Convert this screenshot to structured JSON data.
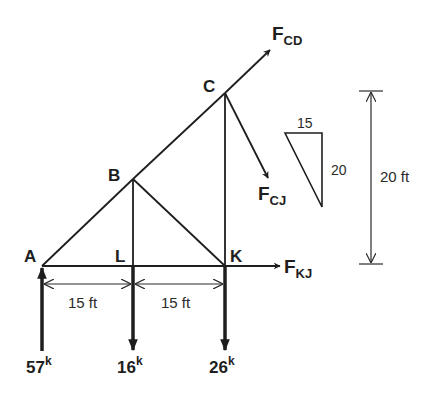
{
  "diagram": {
    "nodes": {
      "A": "A",
      "B": "B",
      "C": "C",
      "K": "K",
      "L": "L"
    },
    "forces": {
      "cd": {
        "main": "F",
        "sub": "CD"
      },
      "cj": {
        "main": "F",
        "sub": "CJ"
      },
      "kj": {
        "main": "F",
        "sub": "KJ"
      }
    },
    "loads": {
      "a": {
        "value": "57",
        "unit": "k",
        "direction": "up"
      },
      "l": {
        "value": "16",
        "unit": "k",
        "direction": "down"
      },
      "k": {
        "value": "26",
        "unit": "k",
        "direction": "down"
      }
    },
    "dimensions": {
      "span_al": "15 ft",
      "span_lk": "15 ft",
      "height": "20 ft"
    },
    "slope_triangle": {
      "horizontal": "15",
      "vertical": "20"
    },
    "colors": {
      "ink": "#1e1e1e",
      "background": "#ffffff"
    }
  }
}
